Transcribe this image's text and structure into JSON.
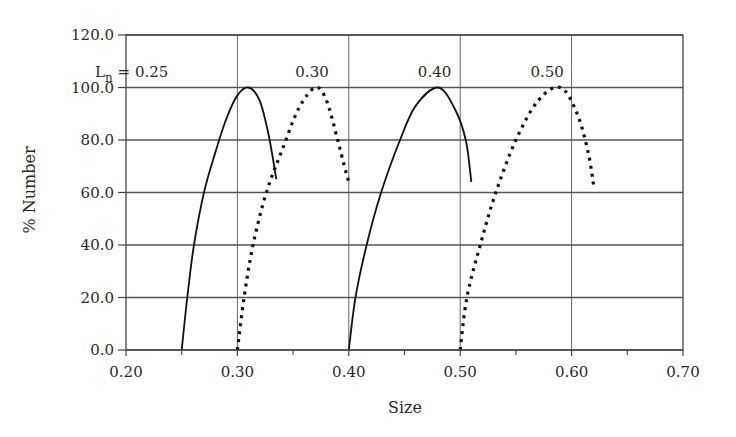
{
  "chart_data": {
    "type": "line",
    "title": "",
    "xlabel": "Size",
    "ylabel": "% Number",
    "xlim": [
      0.2,
      0.7
    ],
    "ylim": [
      0,
      120
    ],
    "x_ticks": [
      "0.20",
      "0.30",
      "0.40",
      "0.50",
      "0.60",
      "0.70"
    ],
    "x_tick_values": [
      0.2,
      0.3,
      0.4,
      0.5,
      0.6,
      0.7
    ],
    "x_minor_ticks": [
      0.25,
      0.35,
      0.45,
      0.55,
      0.65
    ],
    "y_ticks": [
      "0.0",
      "20.0",
      "40.0",
      "60.0",
      "80.0",
      "100.0",
      "120.0"
    ],
    "y_tick_values": [
      0,
      20,
      40,
      60,
      80,
      100,
      120
    ],
    "grid": true,
    "legend": "none",
    "annotations": [
      {
        "text_main": "L",
        "text_sub": "n",
        "text_rest": " = 0.25",
        "x": 0.238,
        "y": 104,
        "anchor": "end"
      },
      {
        "text_main": "0.30",
        "text_sub": "",
        "text_rest": "",
        "x": 0.367,
        "y": 104,
        "anchor": "middle"
      },
      {
        "text_main": "0.40",
        "text_sub": "",
        "text_rest": "",
        "x": 0.477,
        "y": 104,
        "anchor": "middle"
      },
      {
        "text_main": "0.50",
        "text_sub": "",
        "text_rest": "",
        "x": 0.578,
        "y": 104,
        "anchor": "middle"
      }
    ],
    "series": [
      {
        "name": "Ln = 0.25",
        "style": "solid",
        "points": [
          [
            0.25,
            0
          ],
          [
            0.255,
            20
          ],
          [
            0.261,
            40
          ],
          [
            0.27,
            60
          ],
          [
            0.28,
            75
          ],
          [
            0.29,
            88
          ],
          [
            0.3,
            97
          ],
          [
            0.31,
            100
          ],
          [
            0.32,
            95
          ],
          [
            0.328,
            82
          ],
          [
            0.335,
            65
          ]
        ]
      },
      {
        "name": "Ln = 0.30",
        "style": "dotted",
        "points": [
          [
            0.3,
            0
          ],
          [
            0.306,
            20
          ],
          [
            0.314,
            40
          ],
          [
            0.326,
            60
          ],
          [
            0.34,
            76
          ],
          [
            0.355,
            92
          ],
          [
            0.37,
            100
          ],
          [
            0.38,
            95
          ],
          [
            0.39,
            80
          ],
          [
            0.396,
            70
          ],
          [
            0.4,
            64
          ]
        ]
      },
      {
        "name": "Ln = 0.40",
        "style": "solid",
        "points": [
          [
            0.4,
            0
          ],
          [
            0.406,
            20
          ],
          [
            0.416,
            40
          ],
          [
            0.429,
            60
          ],
          [
            0.446,
            80
          ],
          [
            0.46,
            93
          ],
          [
            0.48,
            100
          ],
          [
            0.495,
            92
          ],
          [
            0.505,
            80
          ],
          [
            0.51,
            64
          ]
        ]
      },
      {
        "name": "Ln = 0.50",
        "style": "dotted",
        "points": [
          [
            0.5,
            0
          ],
          [
            0.506,
            20
          ],
          [
            0.518,
            40
          ],
          [
            0.532,
            60
          ],
          [
            0.55,
            80
          ],
          [
            0.57,
            95
          ],
          [
            0.59,
            100
          ],
          [
            0.605,
            90
          ],
          [
            0.615,
            75
          ],
          [
            0.62,
            62
          ]
        ]
      }
    ]
  },
  "colors": {
    "line": "#111111",
    "grid": "#555555",
    "axis": "#444444"
  }
}
